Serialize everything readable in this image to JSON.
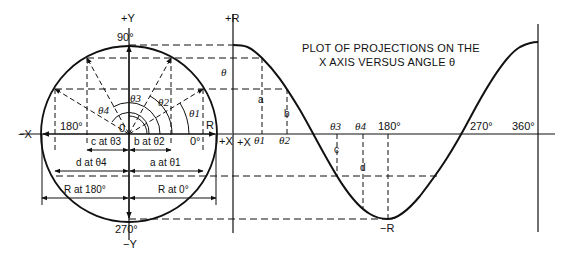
{
  "diagram": {
    "title_line1": "PLOT OF PROJECTIONS ON THE",
    "title_line2": "X AXIS VERSUS ANGLE θ",
    "circle": {
      "axis_labels": {
        "plus_y": "+Y",
        "minus_y": "−Y",
        "plus_x": "+X",
        "minus_x": "−X",
        "deg90": "90°",
        "deg270": "270°",
        "deg180": "180°",
        "deg0": "0°",
        "origin": "0",
        "radius": "R"
      },
      "angles": [
        "θ1",
        "θ2",
        "θ3",
        "θ4"
      ],
      "dimensions": {
        "c": "c at θ3",
        "b": "b at θ2",
        "d": "d at θ4",
        "a": "a at θ1",
        "r180": "R at 180°",
        "r0": "R at 0°"
      }
    },
    "plot": {
      "y_top": "+R",
      "y_bottom": "−R",
      "origin_x_label": "+X",
      "theta_label": "θ",
      "x_ticks": [
        "θ1",
        "θ2",
        "θ3",
        "θ4",
        "180°",
        "270°",
        "360°"
      ],
      "segment_labels": [
        "a",
        "b",
        "c",
        "d"
      ]
    },
    "colors": {
      "line": "#111111",
      "background": "#ffffff"
    }
  }
}
